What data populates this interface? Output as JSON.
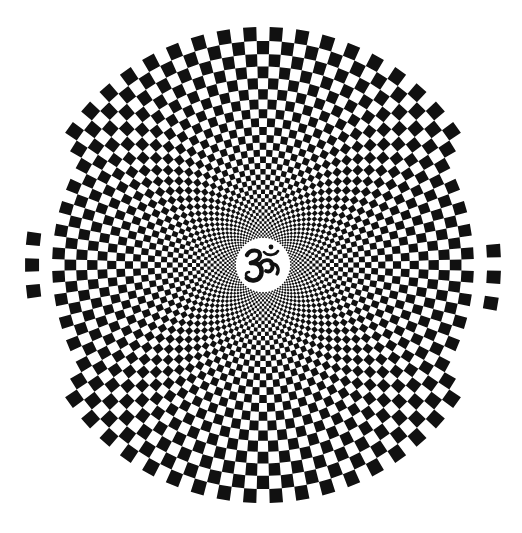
{
  "figure": {
    "title": "Radial checkerboard mandala with Om symbol",
    "background_color": "#ffffff",
    "ink_color": "#111111"
  },
  "pattern": {
    "type": "polar-checkerboard",
    "center": {
      "x": 263,
      "y": 265
    },
    "outer_radius": 238,
    "inner_radius": 27,
    "sectors": 112,
    "rings": 36,
    "ring_spacing": "geometric",
    "faded_regions": [
      {
        "side": "left",
        "angle_start_deg": 150,
        "angle_end_deg": 210,
        "rings_removed": 2
      },
      {
        "side": "right",
        "angle_start_deg": -30,
        "angle_end_deg": 30,
        "rings_removed": 2
      }
    ],
    "detached_squares": [
      {
        "side": "left",
        "angle_deg": 173.5
      },
      {
        "side": "left",
        "angle_deg": 180.0
      },
      {
        "side": "left",
        "angle_deg": 186.5
      },
      {
        "side": "right",
        "angle_deg": -9.5
      },
      {
        "side": "right",
        "angle_deg": -3.0
      },
      {
        "side": "right",
        "angle_deg": 3.5
      }
    ]
  },
  "center_symbol": {
    "name": "Om",
    "glyph": "ॐ",
    "disc_color": "#ffffff",
    "symbol_color": "#111111"
  }
}
